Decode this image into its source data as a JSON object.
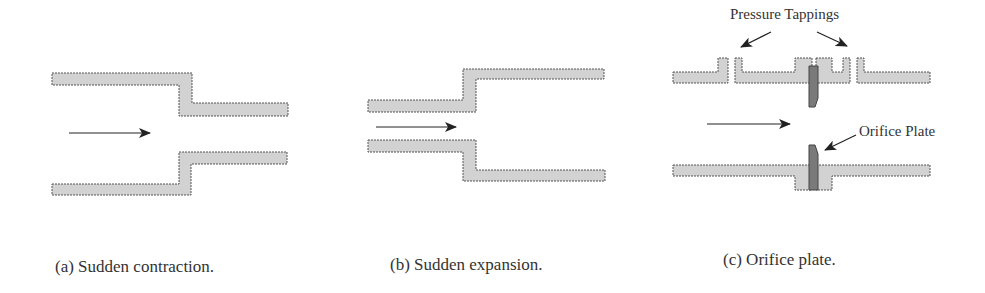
{
  "figure": {
    "panels": [
      {
        "id": "a",
        "caption": "(a) Sudden contraction.",
        "description": "Flow from wide pipe into narrower pipe"
      },
      {
        "id": "b",
        "caption": "(b) Sudden expansion.",
        "description": "Flow from narrow pipe into wider pipe"
      },
      {
        "id": "c",
        "caption": "(c) Orifice plate.",
        "description": "Pipe with orifice plate between flanges and pressure tappings"
      }
    ],
    "annotations": {
      "pressure_tappings": "Pressure Tappings",
      "orifice_plate": "Orifice Plate"
    },
    "colors": {
      "pipe_wall_fill": "#d2d2d2",
      "pipe_wall_stroke": "#555555",
      "orifice_plate_fill": "#7a7a7a",
      "arrow": "#222222",
      "text": "#333333",
      "background": "#ffffff"
    }
  }
}
